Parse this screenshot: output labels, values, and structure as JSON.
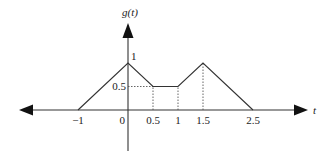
{
  "diagram": {
    "title": "g(t)",
    "y_axis_label": "g(t)",
    "x_axis_label": "t",
    "line_color": "#333333",
    "guide_color": "#555555"
  },
  "chart_data": {
    "type": "line",
    "title": "",
    "xlabel": "t",
    "ylabel": "g(t)",
    "x": [
      -1,
      0,
      0.5,
      1,
      1.5,
      2.5
    ],
    "y": [
      0,
      1,
      0.5,
      0.5,
      1,
      0
    ],
    "series": [
      {
        "name": "g(t)",
        "x": [
          -1,
          0,
          0.5,
          1,
          1.5,
          2.5
        ],
        "y": [
          0,
          1,
          0.5,
          0.5,
          1,
          0
        ]
      }
    ],
    "x_tick_labels": [
      "-1",
      "0",
      "0.5",
      "1",
      "1.5",
      "2.5"
    ],
    "x_ticks": [
      -1,
      0,
      0.5,
      1,
      1.5,
      2.5
    ],
    "y_tick_labels": [
      "1",
      "0.5"
    ],
    "y_ticks": [
      1,
      0.5
    ],
    "dotted_guides": [
      {
        "type": "vertical",
        "x": 0.5,
        "from_y": 0,
        "to_y": 0.5
      },
      {
        "type": "vertical",
        "x": 1,
        "from_y": 0,
        "to_y": 0.5
      },
      {
        "type": "vertical",
        "x": 1.5,
        "from_y": 0,
        "to_y": 1
      },
      {
        "type": "horizontal",
        "y": 0.5,
        "from_x": 0,
        "to_x": 0.5
      }
    ],
    "grid": false,
    "legend": "none"
  }
}
